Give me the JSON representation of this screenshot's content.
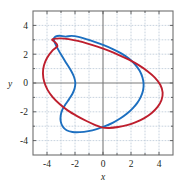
{
  "figure": {
    "background_color": "#ffffff",
    "frame_color": "#6f6f6f",
    "grid_color": "#b9c6d6",
    "axis_color": "#7a7a7a",
    "tick_color": "#555555"
  },
  "chart_data": {
    "type": "line",
    "title": "",
    "subtitle": "",
    "xlabel": "x",
    "ylabel": "y",
    "xlim": [
      -5,
      5
    ],
    "ylim": [
      -5,
      5
    ],
    "grid": true,
    "grid_step": 1,
    "legend": "none",
    "x_ticks": [
      -4,
      -2,
      0,
      2,
      4
    ],
    "x_tick_labels": [
      "-4",
      "-2",
      "0",
      "2",
      "4"
    ],
    "y_ticks": [
      4,
      2,
      0,
      -2,
      -4
    ],
    "y_tick_labels": [
      "4",
      "2",
      "0",
      "-2",
      "-4"
    ],
    "x_minor_ticks": [
      -5,
      -4,
      -3,
      -2,
      -1,
      0,
      1,
      2,
      3,
      4,
      5
    ],
    "y_minor_ticks": [
      -5,
      -4,
      -3,
      -2,
      -1,
      0,
      1,
      2,
      3,
      4,
      5
    ],
    "annotations": [],
    "series": [
      {
        "name": "blue-curve",
        "color": "#1c6fc0",
        "linewidth": 1.9,
        "closed": true,
        "x_range": [
          -3.55,
          2.92
        ],
        "y_range": [
          -3.42,
          3.3
        ],
        "points": [
          [
            -2.68,
            3.22
          ],
          [
            -2.25,
            3.27
          ],
          [
            -1.75,
            3.2
          ],
          [
            -1.2,
            3.05
          ],
          [
            -0.6,
            2.86
          ],
          [
            0.05,
            2.63
          ],
          [
            0.7,
            2.36
          ],
          [
            1.3,
            2.06
          ],
          [
            1.85,
            1.7
          ],
          [
            2.28,
            1.3
          ],
          [
            2.62,
            0.85
          ],
          [
            2.82,
            0.38
          ],
          [
            2.9,
            -0.08
          ],
          [
            2.86,
            -0.52
          ],
          [
            2.7,
            -0.96
          ],
          [
            2.45,
            -1.38
          ],
          [
            2.12,
            -1.76
          ],
          [
            1.72,
            -2.12
          ],
          [
            1.25,
            -2.45
          ],
          [
            0.72,
            -2.75
          ],
          [
            0.15,
            -3.0
          ],
          [
            -0.45,
            -3.2
          ],
          [
            -1.05,
            -3.34
          ],
          [
            -1.65,
            -3.41
          ],
          [
            -2.18,
            -3.4
          ],
          [
            -2.6,
            -3.28
          ],
          [
            -2.88,
            -3.02
          ],
          [
            -3.02,
            -2.66
          ],
          [
            -3.02,
            -2.25
          ],
          [
            -2.9,
            -1.85
          ],
          [
            -2.68,
            -1.48
          ],
          [
            -2.42,
            -1.12
          ],
          [
            -2.18,
            -0.75
          ],
          [
            -2.02,
            -0.35
          ],
          [
            -1.98,
            0.05
          ],
          [
            -2.08,
            0.45
          ],
          [
            -2.3,
            0.88
          ],
          [
            -2.6,
            1.35
          ],
          [
            -2.92,
            1.85
          ],
          [
            -3.2,
            2.32
          ],
          [
            -3.42,
            2.75
          ],
          [
            -3.52,
            3.05
          ],
          [
            -3.4,
            3.22
          ],
          [
            -3.1,
            3.28
          ]
        ]
      },
      {
        "name": "red-curve",
        "color": "#be1e2d",
        "linewidth": 1.9,
        "closed": true,
        "x_range": [
          -4.3,
          4.28
        ],
        "y_range": [
          -3.12,
          3.12
        ],
        "points": [
          [
            -3.55,
            3.06
          ],
          [
            -3.05,
            3.1
          ],
          [
            -2.45,
            3.05
          ],
          [
            -1.8,
            2.92
          ],
          [
            -1.1,
            2.74
          ],
          [
            -0.4,
            2.52
          ],
          [
            0.35,
            2.26
          ],
          [
            1.1,
            1.96
          ],
          [
            1.85,
            1.62
          ],
          [
            2.55,
            1.24
          ],
          [
            3.18,
            0.82
          ],
          [
            3.72,
            0.36
          ],
          [
            4.1,
            -0.14
          ],
          [
            4.26,
            -0.66
          ],
          [
            4.18,
            -1.18
          ],
          [
            3.9,
            -1.66
          ],
          [
            3.48,
            -2.08
          ],
          [
            2.95,
            -2.44
          ],
          [
            2.35,
            -2.72
          ],
          [
            1.72,
            -2.93
          ],
          [
            1.08,
            -3.06
          ],
          [
            0.45,
            -3.12
          ],
          [
            -0.1,
            -3.08
          ],
          [
            -0.55,
            -2.92
          ],
          [
            -1.18,
            -2.64
          ],
          [
            -1.85,
            -2.3
          ],
          [
            -2.5,
            -1.92
          ],
          [
            -3.08,
            -1.48
          ],
          [
            -3.58,
            -1.0
          ],
          [
            -3.96,
            -0.48
          ],
          [
            -4.2,
            0.08
          ],
          [
            -4.29,
            0.66
          ],
          [
            -4.22,
            1.22
          ],
          [
            -4.0,
            1.74
          ],
          [
            -3.66,
            2.2
          ],
          [
            -3.25,
            2.58
          ],
          [
            -3.45,
            2.86
          ],
          [
            -3.62,
            2.98
          ]
        ]
      }
    ]
  }
}
